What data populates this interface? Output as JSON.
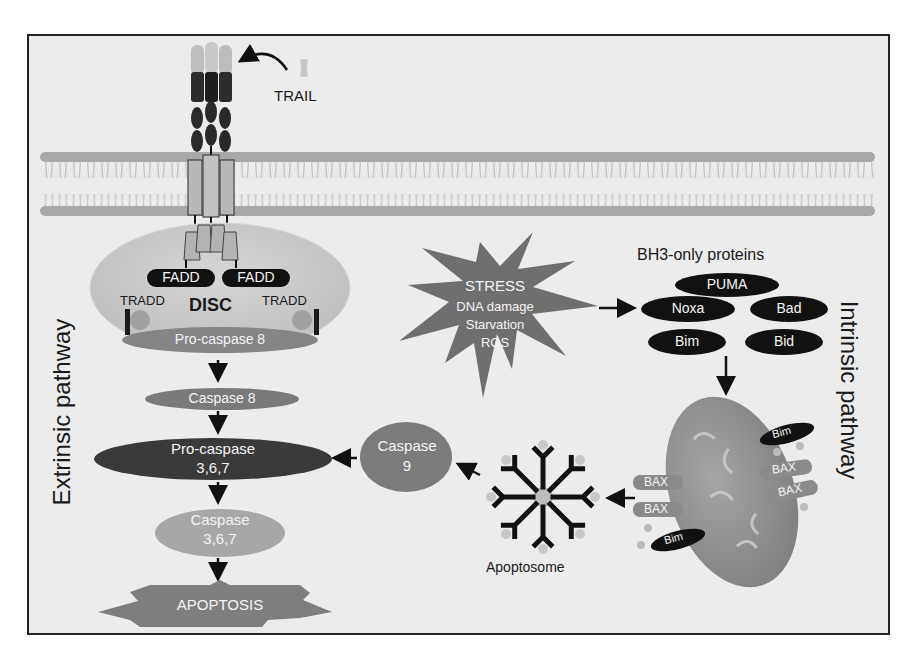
{
  "figure": {
    "ligand_label": "TRAIL",
    "disc": {
      "label": "DISC",
      "fadd_left": "FADD",
      "fadd_right": "FADD",
      "tradd_left": "TRADD",
      "tradd_right": "TRADD",
      "procaspase8": "Pro-caspase 8"
    },
    "extrinsic": {
      "side_label": "Extrinsic pathway",
      "caspase8": "Caspase 8",
      "procaspase367_line1": "Pro-caspase",
      "procaspase367_line2": "3,6,7",
      "caspase367_line1": "Caspase",
      "caspase367_line2": "3,6,7",
      "apoptosis": "APOPTOSIS"
    },
    "stress": {
      "title": "STRESS",
      "items": [
        "DNA damage",
        "Starvation",
        "ROS"
      ]
    },
    "bh3": {
      "title": "BH3-only proteins",
      "proteins": [
        "PUMA",
        "Noxa",
        "Bad",
        "Bim",
        "Bid"
      ]
    },
    "intrinsic": {
      "side_label": "Intrinsic pathway",
      "mito_labels": {
        "bim_top": "Bim",
        "bax_right_1": "BAX",
        "bax_right_2": "BAX",
        "bax_left_1": "BAX",
        "bax_left_2": "BAX",
        "bim_bottom": "Bim"
      },
      "apoptosome": "Apoptosome",
      "caspase9_line1": "Caspase",
      "caspase9_line2": "9"
    },
    "colors": {
      "background": "#ececec",
      "frame": "#222222",
      "membrane_head": "#a8a8a8",
      "membrane_tail": "#cfcfcf",
      "dark_node": "#141414",
      "mid_node": "#7a7a7a",
      "dark_grey_node": "#3e3e3e",
      "light_node": "#a5a5a5",
      "disc_oval": "#cbcbcb",
      "stress_star": "#6e6e6e",
      "mitochondrion": "#8f8f8f",
      "arrow": "#111111"
    }
  }
}
